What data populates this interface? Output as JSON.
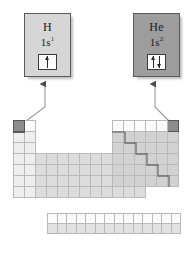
{
  "figure": {
    "type": "periodic-table-orbital-diagram",
    "caption": "",
    "callouts": [
      {
        "id": "hydrogen",
        "element_symbol": "H",
        "configuration_base": "1s",
        "configuration_exponent": "1",
        "orbital_box": {
          "label": "1s-orbital-box",
          "electrons": 1,
          "spins": [
            "up"
          ]
        },
        "box_fill": "#d6d6d6",
        "points_to": "s-block-period-1-group-1"
      },
      {
        "id": "helium",
        "element_symbol": "He",
        "configuration_base": "1s",
        "configuration_exponent": "2",
        "orbital_box": {
          "label": "1s-orbital-box",
          "electrons": 2,
          "spins": [
            "up",
            "down"
          ]
        },
        "box_fill": "#9d9d9d",
        "points_to": "p-block-period-1-group-18"
      }
    ],
    "periodic_table": {
      "blocks": [
        {
          "name": "s-block",
          "columns": 2,
          "rows": 7,
          "fill": "#eeeeee",
          "highlighted_cell": {
            "row": 1,
            "col": 1,
            "element": "H",
            "fill": "#8c8c8c"
          }
        },
        {
          "name": "d-block",
          "columns": 10,
          "rows": 4,
          "fill": "#dcdcdc"
        },
        {
          "name": "p-block",
          "columns": 6,
          "rows": 6,
          "fill": "#d2d2d2",
          "highlighted_cell": {
            "row": 1,
            "col": 6,
            "element": "He",
            "fill": "#8c8c8c"
          },
          "metalloid_staircase": true
        },
        {
          "name": "f-block",
          "columns": 14,
          "rows": 2,
          "fill": "#e2e2e2"
        }
      ]
    },
    "colors": {
      "outline": "#5a5a5a",
      "gridline": "#b9b9b9",
      "highlight": "#8c8c8c",
      "staircase": "#6e6e6e",
      "connector": "#8a8a8a",
      "background": "#ffffff"
    }
  }
}
